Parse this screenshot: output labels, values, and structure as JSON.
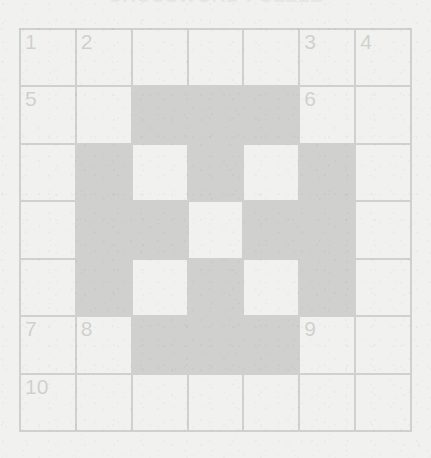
{
  "document": {
    "type": "crossword-puzzle",
    "title": "CROSSWORD PUZZLE",
    "background_color": "#f1f1ef",
    "ink_color": "#17171a",
    "cell_color": "#f4f4f2"
  },
  "grid": {
    "rows": 7,
    "columns": 7,
    "legend": {
      "white": "open letter cell",
      "black": "blocked cell"
    },
    "cells": [
      [
        {
          "type": "white",
          "number": "1"
        },
        {
          "type": "white",
          "number": "2"
        },
        {
          "type": "white",
          "number": ""
        },
        {
          "type": "white",
          "number": ""
        },
        {
          "type": "white",
          "number": ""
        },
        {
          "type": "white",
          "number": "3"
        },
        {
          "type": "white",
          "number": "4"
        }
      ],
      [
        {
          "type": "white",
          "number": "5"
        },
        {
          "type": "white",
          "number": ""
        },
        {
          "type": "black",
          "number": ""
        },
        {
          "type": "black",
          "number": ""
        },
        {
          "type": "black",
          "number": ""
        },
        {
          "type": "white",
          "number": "6"
        },
        {
          "type": "white",
          "number": ""
        }
      ],
      [
        {
          "type": "white",
          "number": ""
        },
        {
          "type": "black",
          "number": ""
        },
        {
          "type": "white",
          "number": ""
        },
        {
          "type": "black",
          "number": ""
        },
        {
          "type": "white",
          "number": ""
        },
        {
          "type": "black",
          "number": ""
        },
        {
          "type": "white",
          "number": ""
        }
      ],
      [
        {
          "type": "white",
          "number": ""
        },
        {
          "type": "black",
          "number": ""
        },
        {
          "type": "black",
          "number": ""
        },
        {
          "type": "white",
          "number": ""
        },
        {
          "type": "black",
          "number": ""
        },
        {
          "type": "black",
          "number": ""
        },
        {
          "type": "white",
          "number": ""
        }
      ],
      [
        {
          "type": "white",
          "number": ""
        },
        {
          "type": "black",
          "number": ""
        },
        {
          "type": "white",
          "number": ""
        },
        {
          "type": "black",
          "number": ""
        },
        {
          "type": "white",
          "number": ""
        },
        {
          "type": "black",
          "number": ""
        },
        {
          "type": "white",
          "number": ""
        }
      ],
      [
        {
          "type": "white",
          "number": "7"
        },
        {
          "type": "white",
          "number": "8"
        },
        {
          "type": "black",
          "number": ""
        },
        {
          "type": "black",
          "number": ""
        },
        {
          "type": "black",
          "number": ""
        },
        {
          "type": "white",
          "number": "9"
        },
        {
          "type": "white",
          "number": ""
        }
      ],
      [
        {
          "type": "white",
          "number": "10"
        },
        {
          "type": "white",
          "number": ""
        },
        {
          "type": "white",
          "number": ""
        },
        {
          "type": "white",
          "number": ""
        },
        {
          "type": "white",
          "number": ""
        },
        {
          "type": "white",
          "number": ""
        },
        {
          "type": "white",
          "number": ""
        }
      ]
    ],
    "clue_numbers": [
      "1",
      "2",
      "3",
      "4",
      "5",
      "6",
      "7",
      "8",
      "9",
      "10"
    ]
  }
}
